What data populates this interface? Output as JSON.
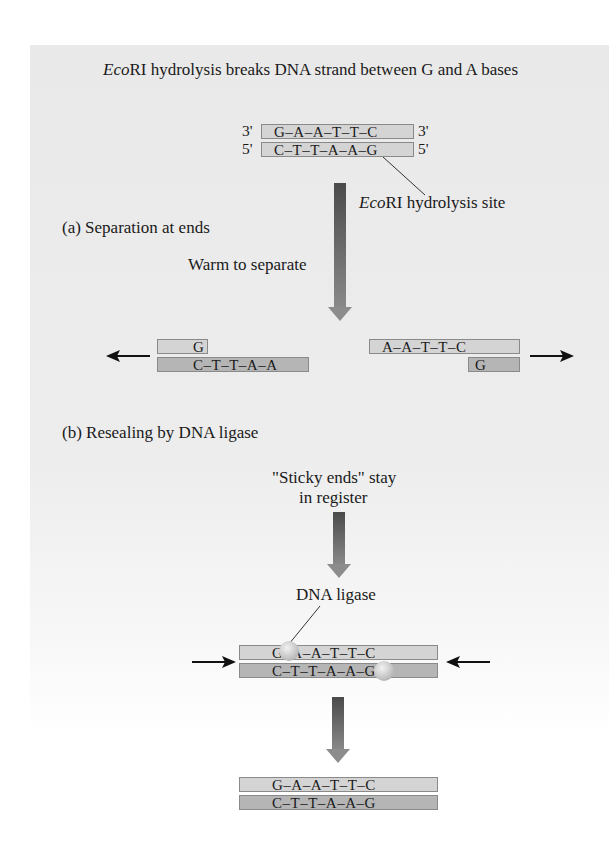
{
  "figure": {
    "title_italic": "Eco",
    "title_rest": "RI hydrolysis breaks DNA strand between G and A bases",
    "colors": {
      "panel_background": "#ebebeb",
      "strand_light": "#d4d4d4",
      "strand_dark": "#b5b5b5",
      "arrow_dark": "#4a4a4a",
      "arrow_light": "#8c8c8c"
    }
  },
  "initial_duplex": {
    "top_left_label": "3'",
    "top_sequence": "G–A–A–T–T–C",
    "top_right_label": "3'",
    "bottom_left_label": "5'",
    "bottom_sequence": "C–T–T–A–A–G",
    "bottom_right_label": "5'",
    "site_label_italic": "Eco",
    "site_label_rest": "RI hydrolysis site"
  },
  "section_a": {
    "heading": "(a)  Separation at ends",
    "step_label": "Warm to separate",
    "left_fragment": {
      "top": "G",
      "bottom": "C–T–T–A–A"
    },
    "right_fragment": {
      "top": "A–A–T–T–C",
      "bottom": "G"
    }
  },
  "section_b": {
    "heading": "(b)  Resealing by DNA ligase",
    "step_label_line1": "\"Sticky ends\" stay",
    "step_label_line2": "in register",
    "enzyme_label": "DNA ligase",
    "ligase_duplex": {
      "top": "G–A–A–T–T–C",
      "bottom": "C–T–T–A–A–G"
    },
    "final_duplex": {
      "top": "G–A–A–T–T–C",
      "bottom": "C–T–T–A–A–G"
    }
  },
  "icons": {
    "down_arrow": "block-arrow-down",
    "left_arrow": "arrow-left",
    "right_arrow": "arrow-right",
    "ligase_site": "sphere"
  }
}
